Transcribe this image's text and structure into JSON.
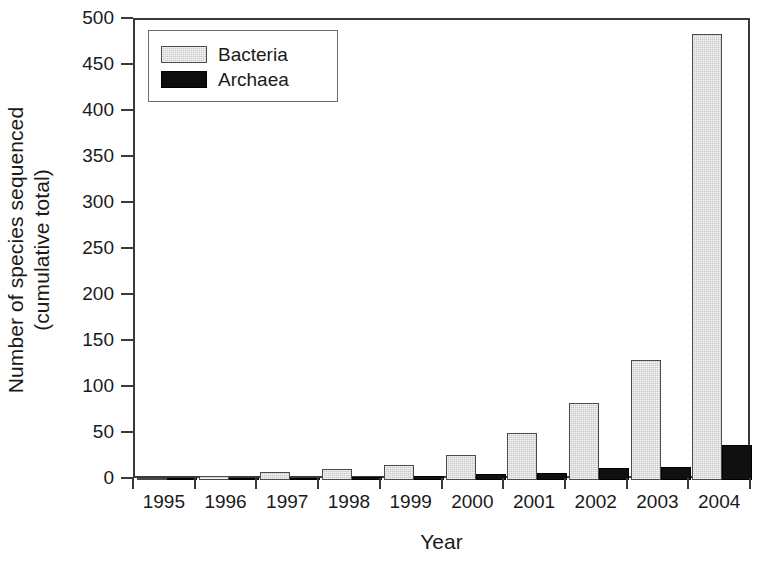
{
  "chart_data": {
    "type": "bar",
    "title": "",
    "xlabel": "Year",
    "ylabel": "Number of species sequenced (cumulative total)",
    "ylabel_line1": "Number of species sequenced",
    "ylabel_line2": "(cumulative total)",
    "categories": [
      "1995",
      "1996",
      "1997",
      "1998",
      "1999",
      "2000",
      "2001",
      "2002",
      "2003",
      "2004"
    ],
    "series": [
      {
        "name": "Bacteria",
        "color": "#c9c9c9",
        "pattern": "stipple",
        "values": [
          2,
          4,
          9,
          12,
          16,
          27,
          51,
          84,
          130,
          485
        ]
      },
      {
        "name": "Archaea",
        "color": "#101010",
        "pattern": "solid",
        "values": [
          0,
          1,
          2,
          3,
          4,
          6,
          8,
          13,
          14,
          38
        ]
      }
    ],
    "ylim": [
      0,
      500
    ],
    "yticks": [
      0,
      50,
      100,
      150,
      200,
      250,
      300,
      350,
      400,
      450,
      500
    ],
    "ytick_labels": [
      "0",
      "50",
      "100",
      "150",
      "200",
      "250",
      "300",
      "350",
      "400",
      "450",
      "500"
    ],
    "grid": false,
    "legend_position": "top-left",
    "legend_entries": [
      "Bacteria",
      "Archaea"
    ]
  },
  "axes": {
    "x_title": "Year",
    "y_title_line1": "Number of species sequenced",
    "y_title_line2": "(cumulative total)"
  },
  "legend": {
    "bacteria_label": "Bacteria",
    "archaea_label": "Archaea"
  }
}
